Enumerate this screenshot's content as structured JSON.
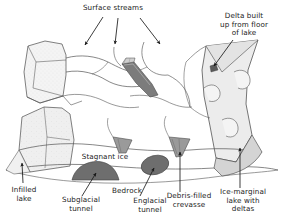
{
  "figure": {
    "background_color": "#ffffff",
    "line_color": "#4a4a4a",
    "ice_fill": "#f2f2f2",
    "debris_dark_fill": "#6e6e6e",
    "debris_mid_fill": "#9a9a9a",
    "lake_fill": "#d9d9d9",
    "text_color": "#222222"
  },
  "labels": {
    "surface_streams": "Surface streams",
    "delta_built": "Delta built\nup from floor\nof lake",
    "stagnant_ice": "Stagnant ice",
    "infilled_lake": "Infilled\nlake",
    "subglacial_tunnel": "Subglacial\ntunnel",
    "bedrock": "Bedrock",
    "englacial_tunnel": "Englacial\ntunnel",
    "debris_filled_crevasse": "Debris-filled\ncrevasse",
    "ice_marginal_lake": "Ice-marginal\nlake with\ndeltas"
  },
  "features": [
    {
      "id": "surface-streams",
      "label": "Surface streams",
      "kind": "meltwater-channel",
      "pointers": 3
    },
    {
      "id": "delta",
      "label": "Delta built up from floor of lake",
      "kind": "sediment-delta",
      "pointers": 1
    },
    {
      "id": "stagnant-ice",
      "label": "Stagnant ice",
      "kind": "ice-mass",
      "pointers": 0
    },
    {
      "id": "infilled-lake",
      "label": "Infilled lake",
      "kind": "lake-basin",
      "pointers": 1
    },
    {
      "id": "subglacial-tunnel",
      "label": "Subglacial tunnel",
      "kind": "tunnel",
      "pointers": 1
    },
    {
      "id": "bedrock",
      "label": "Bedrock",
      "kind": "substrate",
      "pointers": 0
    },
    {
      "id": "englacial-tunnel",
      "label": "Englacial tunnel",
      "kind": "tunnel",
      "pointers": 1
    },
    {
      "id": "debris-filled-crevasse",
      "label": "Debris-filled crevasse",
      "kind": "crevasse-fill",
      "pointers": 1
    },
    {
      "id": "ice-marginal-lake",
      "label": "Ice-marginal lake with deltas",
      "kind": "lake-basin",
      "pointers": 1
    }
  ]
}
